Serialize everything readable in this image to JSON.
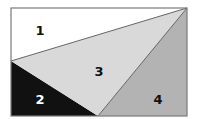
{
  "diagram": {
    "title": "",
    "rectangle": {
      "x": 11,
      "y": 8,
      "width": 176,
      "height": 108,
      "stroke": "#7a7a7a"
    },
    "regions": [
      {
        "id": "1",
        "label": "1",
        "fill": "#ffffff",
        "text_color": "#111111",
        "label_x": 40,
        "label_y": 30
      },
      {
        "id": "2",
        "label": "2",
        "fill": "#111111",
        "text_color": "#ffffff",
        "label_x": 40,
        "label_y": 99
      },
      {
        "id": "3",
        "label": "3",
        "fill": "#d9d9d9",
        "text_color": "#111111",
        "label_x": 99,
        "label_y": 71
      },
      {
        "id": "4",
        "label": "4",
        "fill": "#b3b3b3",
        "text_color": "#111111",
        "label_x": 158,
        "label_y": 99
      }
    ]
  }
}
